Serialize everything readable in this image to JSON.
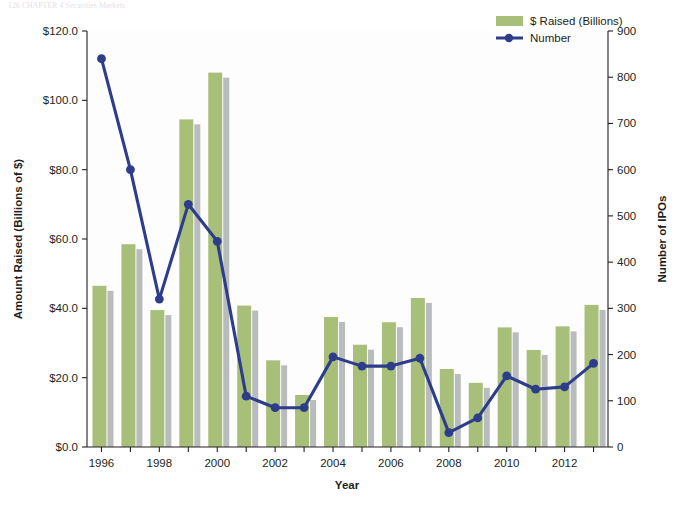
{
  "bleed_text": {
    "line1": "126      CHAPTER 4      Securities Markets"
  },
  "chart_data": {
    "type": "bar",
    "title": "",
    "subtitle": "",
    "xlabel": "Year",
    "ylabel": "Amount Raised (Billions of $)",
    "y2label": "Number of IPOs",
    "grid": false,
    "legend_position": "top-right",
    "categories": [
      1996,
      1997,
      1998,
      1999,
      2000,
      2001,
      2002,
      2003,
      2004,
      2005,
      2006,
      2007,
      2008,
      2009,
      2010,
      2011,
      2012,
      2013
    ],
    "x_tick_labels": [
      "1996",
      "",
      "1998",
      "",
      "2000",
      "",
      "2002",
      "",
      "2004",
      "",
      "2006",
      "",
      "2008",
      "",
      "2010",
      "",
      "2012",
      ""
    ],
    "y_tick_labels": [
      "$0.0",
      "$20.0",
      "$40.0",
      "$60.0",
      "$80.0",
      "$100.0",
      "$120.0"
    ],
    "y_tick_values": [
      0,
      20,
      40,
      60,
      80,
      100,
      120
    ],
    "ylim": [
      0,
      120
    ],
    "y2_tick_labels": [
      "0",
      "100",
      "200",
      "300",
      "400",
      "500",
      "600",
      "700",
      "800",
      "900"
    ],
    "y2_tick_values": [
      0,
      100,
      200,
      300,
      400,
      500,
      600,
      700,
      800,
      900
    ],
    "y2lim": [
      0,
      900
    ],
    "series": [
      {
        "name": "$ Raised (Billions)",
        "kind": "bar",
        "axis": "left",
        "color": "#a8bf7a",
        "shadow_color": "#b9bcbd",
        "values": [
          46.5,
          58.5,
          39.5,
          94.5,
          108.0,
          40.8,
          25.0,
          15.0,
          37.5,
          29.5,
          36.0,
          43.0,
          22.5,
          18.5,
          34.5,
          28.0,
          34.8,
          41.0
        ]
      },
      {
        "name": "Number",
        "kind": "line",
        "axis": "right",
        "color": "#2d3d8c",
        "marker": "circle",
        "values": [
          840,
          600,
          320,
          525,
          445,
          110,
          85,
          85,
          195,
          175,
          175,
          192,
          31,
          63,
          154,
          125,
          130,
          181
        ]
      }
    ]
  },
  "legend": {
    "items": [
      {
        "label": "$ Raised (Billions)",
        "type": "swatch",
        "color": "#a8bf7a"
      },
      {
        "label": "Number",
        "type": "line-marker",
        "color": "#2d3d8c"
      }
    ]
  }
}
